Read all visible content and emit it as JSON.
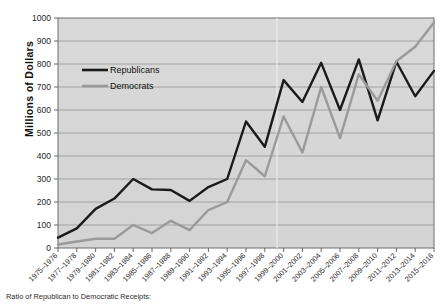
{
  "title_strip": "",
  "footer": {
    "text": "Ratio of Republican to Democratic Receipts:"
  },
  "axis": {
    "ylabel": "Millions of Dollars",
    "yticks": [
      "0",
      "100",
      "200",
      "300",
      "400",
      "500",
      "600",
      "700",
      "800",
      "900",
      "1000"
    ]
  },
  "legend": {
    "items": [
      {
        "label": "Republicans",
        "color": "#1a1a1a"
      },
      {
        "label": "Democrats",
        "color": "#9a9a9a"
      }
    ]
  },
  "chart_data": {
    "type": "line",
    "title": "",
    "xlabel": "",
    "ylabel": "Millions of Dollars",
    "ylim": [
      0,
      1000
    ],
    "ytick_step": 100,
    "grid": true,
    "legend_position": "upper-left-inside",
    "categories": [
      "1975–1976",
      "1977–1978",
      "1979–1980",
      "1981–1982",
      "1983–1984",
      "1985–1986",
      "1987–1988",
      "1989–1990",
      "1991–1992",
      "1993–1994",
      "1995–1996",
      "1997–1998",
      "1999–2000",
      "2001–2002",
      "2003–2004",
      "2005–2006",
      "2007–2008",
      "2009–2010",
      "2011–2012",
      "2013–2014",
      "2015–2016"
    ],
    "series": [
      {
        "name": "Republicans",
        "color": "#1a1a1a",
        "values": [
          45,
          85,
          170,
          215,
          300,
          255,
          252,
          205,
          265,
          300,
          550,
          440,
          730,
          635,
          805,
          600,
          820,
          555,
          810,
          660,
          770
        ]
      },
      {
        "name": "Democrats",
        "color": "#9a9a9a",
        "values": [
          15,
          28,
          40,
          40,
          100,
          65,
          118,
          78,
          165,
          200,
          382,
          312,
          572,
          415,
          700,
          478,
          755,
          640,
          812,
          875,
          980
        ]
      }
    ]
  }
}
